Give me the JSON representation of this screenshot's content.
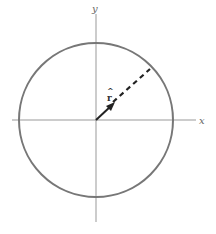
{
  "diagram": {
    "axes": {
      "x_label": "x",
      "y_label": "y"
    },
    "circle": {
      "cx": 96,
      "cy": 120,
      "r": 77,
      "stroke": "#777777"
    },
    "vector": {
      "label": "r",
      "hat": "^",
      "description": "unit radial vector with dashed extension to circle"
    },
    "colors": {
      "axis": "#999999",
      "circle": "#777777",
      "vector": "#222222"
    }
  }
}
